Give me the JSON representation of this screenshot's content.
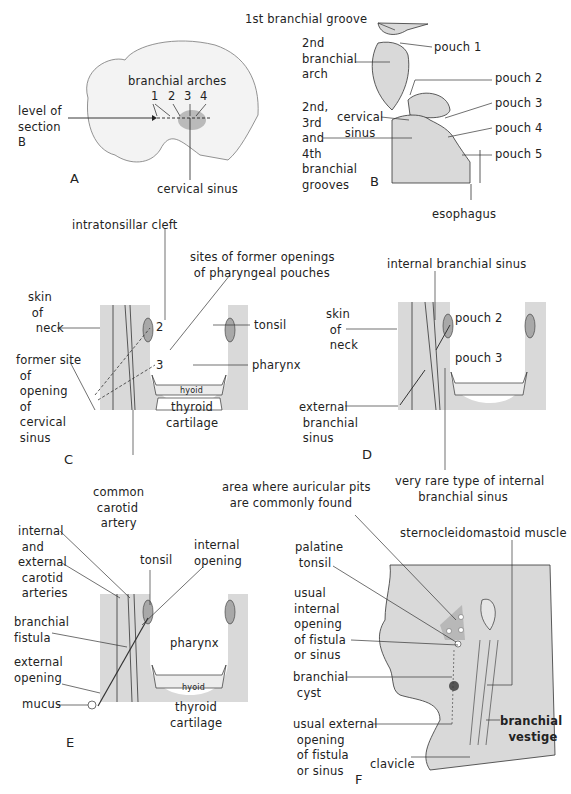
{
  "figure": {
    "panels": {
      "A": {
        "letter": "A",
        "labels": {
          "branchial_arches": "branchial arches",
          "arch_numbers": [
            "1",
            "2",
            "3",
            "4"
          ],
          "level_of_section": "level of\nsection\nB",
          "cervical_sinus": "cervical sinus"
        }
      },
      "B": {
        "letter": "B",
        "labels": {
          "first_groove": "1st branchial groove",
          "second_arch": "2nd\nbranchial\narch",
          "pouch1": "pouch 1",
          "pouch2": "pouch 2",
          "pouch3": "pouch 3",
          "pouch4": "pouch 4",
          "pouch5": "pouch 5",
          "cervical_sinus": "cervical\n  sinus",
          "grooves": "2nd,\n3rd\nand\n4th\nbranchial\ngrooves",
          "esophagus": "esophagus"
        }
      },
      "C": {
        "letter": "C",
        "labels": {
          "intratonsillar_cleft": "intratonsillar cleft",
          "sites_former": "sites of former openings\n of pharyngeal pouches",
          "skin_of_neck": "skin\n of\n  neck",
          "tonsil": "tonsil",
          "num2": "2",
          "num3": "3",
          "pharynx": "pharynx",
          "former_site": "former site\n of\n opening\n of\n cervical\n sinus",
          "hyoid": "hyoid",
          "thyroid_cartilage": "thyroid\ncartilage",
          "common_carotid": "common\n carotid\n  artery"
        }
      },
      "D": {
        "letter": "D",
        "labels": {
          "internal_branchial_sinus": "internal branchial sinus",
          "skin_of_neck": "skin\n of\n neck",
          "pouch2": "pouch 2",
          "pouch3": "pouch 3",
          "external_branchial_sinus": "external\n branchial\n sinus",
          "very_rare": "very rare type of internal\n      branchial sinus"
        }
      },
      "E": {
        "letter": "E",
        "labels": {
          "carotid_arteries": "internal\n and\nexternal\n carotid\n arteries",
          "tonsil": "tonsil",
          "internal_opening": "internal\nopening",
          "branchial_fistula": "branchial\nfistula",
          "pharynx": "pharynx",
          "external_opening": "external\nopening",
          "mucus": "mucus",
          "hyoid": "hyoid",
          "thyroid_cartilage": "thyroid\ncartilage"
        }
      },
      "F": {
        "letter": "F",
        "labels": {
          "auricular_pits": "area where auricular pits\n  are commonly found",
          "sternocleidomastoid": "sternocleidomastoid muscle",
          "palatine_tonsil": "palatine\n tonsil",
          "usual_internal": "usual\ninternal\nopening\nof fistula\nor sinus",
          "branchial_cyst": "branchial\n cyst",
          "usual_external": "usual external\n opening\n of fistula\n or sinus",
          "branchial_vestige": "branchial\n  vestige",
          "clavicle": "clavicle"
        }
      }
    },
    "colors": {
      "tissue_gray": "#d9d9d9",
      "line": "#333333",
      "tonsil_gray": "#a8a8a8",
      "cyst_dark": "#555555"
    }
  }
}
